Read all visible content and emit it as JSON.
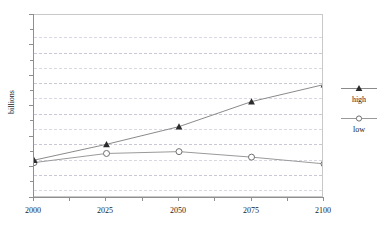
{
  "chart_data": {
    "type": "line",
    "title": "",
    "xlabel": "",
    "ylabel": "billions",
    "x": [
      2000,
      2025,
      2050,
      2075,
      2100
    ],
    "xtick_labels": [
      "2000",
      "2025",
      "2050",
      "2075",
      "2100"
    ],
    "ytick_labels": [
      "0",
      "5",
      "10",
      "15",
      "20",
      "25",
      "30"
    ],
    "yticks": [
      0,
      5,
      10,
      15,
      20,
      25,
      30
    ],
    "xlim": [
      2000,
      2100
    ],
    "ylim": [
      0,
      30
    ],
    "grid": true,
    "grid_minor_step": 2.5,
    "legend_position": "right",
    "series": [
      {
        "name": "high",
        "marker": "filled-triangle",
        "color": "#2b2b2b",
        "values": [
          6.2,
          8.8,
          11.7,
          15.8,
          18.6
        ]
      },
      {
        "name": "low",
        "marker": "open-circle",
        "color": "#8d8d8d",
        "values": [
          5.8,
          7.3,
          7.6,
          6.7,
          5.6
        ]
      }
    ]
  },
  "axes": {
    "y_title": "billions",
    "y_labels": [
      "30",
      "25",
      "20",
      "15",
      "10",
      "5",
      "0"
    ],
    "x_labels": [
      "2000",
      "2025",
      "2050",
      "2075",
      "2100"
    ]
  },
  "legend": {
    "entries": [
      {
        "label": "high",
        "marker": "filled-triangle-icon"
      },
      {
        "label": "low",
        "marker": "open-circle-icon"
      }
    ]
  }
}
